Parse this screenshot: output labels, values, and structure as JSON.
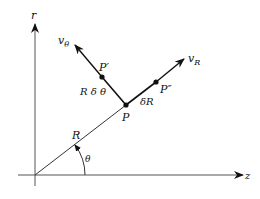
{
  "diagram": {
    "colors": {
      "ink": "#111111",
      "axis": "#555555",
      "background": "#ffffff"
    },
    "axes": {
      "vertical": {
        "label": "r"
      },
      "horizontal": {
        "label": "z"
      }
    },
    "points": {
      "P": {
        "label": "P"
      },
      "P_prime": {
        "label": "P′"
      },
      "P_double_prime": {
        "label": "P″"
      }
    },
    "vectors": {
      "v_theta": {
        "symbol": "v",
        "subscript": "θ"
      },
      "v_R": {
        "symbol": "v",
        "subscript": "R"
      }
    },
    "segments": {
      "radius": {
        "label": "R"
      },
      "arc_displacement": {
        "label": "R δ θ"
      },
      "radial_displacement": {
        "label": "δR"
      }
    },
    "angle": {
      "label": "θ"
    }
  }
}
